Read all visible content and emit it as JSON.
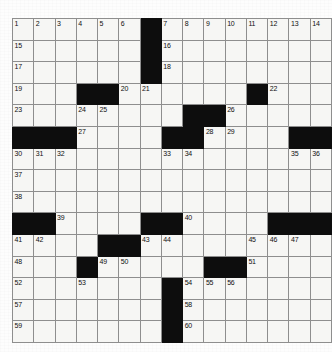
{
  "puzzle": {
    "title": "Crossword Grid",
    "columns": 14,
    "rows": 15,
    "colors": {
      "block": "#0d0d0d",
      "cell": "#f6f6f4",
      "grid_line": "#8e8e8e",
      "number_text": "#101010",
      "page_background": "#fdfdfd"
    },
    "numbers_sequence": [
      1,
      2,
      3,
      4,
      5,
      6,
      7,
      8,
      9,
      10,
      11,
      12,
      13,
      14,
      15,
      16,
      17,
      18,
      19,
      20,
      21,
      22,
      23,
      24,
      25,
      26,
      27,
      28,
      29,
      30,
      31,
      32,
      33,
      34,
      35,
      36,
      37,
      38,
      39,
      40,
      41,
      42,
      43,
      44,
      45,
      46,
      47,
      48,
      49,
      50,
      51,
      52,
      53,
      54,
      55,
      56,
      57,
      58,
      59,
      60
    ],
    "highest_number": 60,
    "grid": [
      [
        {
          "block": false,
          "number": "1"
        },
        {
          "block": false,
          "number": "2"
        },
        {
          "block": false,
          "number": "3"
        },
        {
          "block": false,
          "number": "4"
        },
        {
          "block": false,
          "number": "5"
        },
        {
          "block": false,
          "number": "6"
        },
        {
          "block": true,
          "number": ""
        },
        {
          "block": false,
          "number": "7"
        },
        {
          "block": false,
          "number": "8"
        },
        {
          "block": false,
          "number": "9"
        },
        {
          "block": false,
          "number": "10"
        },
        {
          "block": false,
          "number": "11"
        },
        {
          "block": false,
          "number": "12"
        },
        {
          "block": false,
          "number": "13"
        },
        {
          "block": false,
          "number": "14"
        }
      ],
      [
        {
          "block": false,
          "number": "15"
        },
        {
          "block": false,
          "number": ""
        },
        {
          "block": false,
          "number": ""
        },
        {
          "block": false,
          "number": ""
        },
        {
          "block": false,
          "number": ""
        },
        {
          "block": false,
          "number": ""
        },
        {
          "block": true,
          "number": ""
        },
        {
          "block": false,
          "number": "16"
        },
        {
          "block": false,
          "number": ""
        },
        {
          "block": false,
          "number": ""
        },
        {
          "block": false,
          "number": ""
        },
        {
          "block": false,
          "number": ""
        },
        {
          "block": false,
          "number": ""
        },
        {
          "block": false,
          "number": ""
        },
        {
          "block": false,
          "number": ""
        }
      ],
      [
        {
          "block": false,
          "number": "17"
        },
        {
          "block": false,
          "number": ""
        },
        {
          "block": false,
          "number": ""
        },
        {
          "block": false,
          "number": ""
        },
        {
          "block": false,
          "number": ""
        },
        {
          "block": false,
          "number": ""
        },
        {
          "block": true,
          "number": ""
        },
        {
          "block": false,
          "number": "18"
        },
        {
          "block": false,
          "number": ""
        },
        {
          "block": false,
          "number": ""
        },
        {
          "block": false,
          "number": ""
        },
        {
          "block": false,
          "number": ""
        },
        {
          "block": false,
          "number": ""
        },
        {
          "block": false,
          "number": ""
        },
        {
          "block": false,
          "number": ""
        }
      ],
      [
        {
          "block": false,
          "number": "19"
        },
        {
          "block": false,
          "number": ""
        },
        {
          "block": false,
          "number": ""
        },
        {
          "block": true,
          "number": ""
        },
        {
          "block": true,
          "number": ""
        },
        {
          "block": false,
          "number": "20"
        },
        {
          "block": false,
          "number": "21"
        },
        {
          "block": false,
          "number": ""
        },
        {
          "block": false,
          "number": ""
        },
        {
          "block": false,
          "number": ""
        },
        {
          "block": false,
          "number": ""
        },
        {
          "block": true,
          "number": ""
        },
        {
          "block": false,
          "number": "22"
        },
        {
          "block": false,
          "number": ""
        },
        {
          "block": false,
          "number": ""
        }
      ],
      [
        {
          "block": false,
          "number": "23"
        },
        {
          "block": false,
          "number": ""
        },
        {
          "block": false,
          "number": ""
        },
        {
          "block": false,
          "number": "24"
        },
        {
          "block": false,
          "number": "25"
        },
        {
          "block": false,
          "number": ""
        },
        {
          "block": false,
          "number": ""
        },
        {
          "block": false,
          "number": ""
        },
        {
          "block": true,
          "number": ""
        },
        {
          "block": true,
          "number": ""
        },
        {
          "block": false,
          "number": "26"
        },
        {
          "block": false,
          "number": ""
        },
        {
          "block": false,
          "number": ""
        },
        {
          "block": false,
          "number": ""
        },
        {
          "block": false,
          "number": ""
        }
      ],
      [
        {
          "block": true,
          "number": ""
        },
        {
          "block": true,
          "number": ""
        },
        {
          "block": true,
          "number": ""
        },
        {
          "block": false,
          "number": "27"
        },
        {
          "block": false,
          "number": ""
        },
        {
          "block": false,
          "number": ""
        },
        {
          "block": false,
          "number": ""
        },
        {
          "block": true,
          "number": ""
        },
        {
          "block": true,
          "number": ""
        },
        {
          "block": false,
          "number": "28"
        },
        {
          "block": false,
          "number": "29"
        },
        {
          "block": false,
          "number": ""
        },
        {
          "block": false,
          "number": ""
        },
        {
          "block": true,
          "number": ""
        },
        {
          "block": true,
          "number": ""
        }
      ],
      [
        {
          "block": false,
          "number": "30"
        },
        {
          "block": false,
          "number": "31"
        },
        {
          "block": false,
          "number": "32"
        },
        {
          "block": false,
          "number": ""
        },
        {
          "block": false,
          "number": ""
        },
        {
          "block": false,
          "number": ""
        },
        {
          "block": false,
          "number": ""
        },
        {
          "block": false,
          "number": "33"
        },
        {
          "block": false,
          "number": "34"
        },
        {
          "block": false,
          "number": ""
        },
        {
          "block": false,
          "number": ""
        },
        {
          "block": false,
          "number": ""
        },
        {
          "block": false,
          "number": ""
        },
        {
          "block": false,
          "number": "35"
        },
        {
          "block": false,
          "number": "36"
        }
      ],
      [
        {
          "block": false,
          "number": "37"
        },
        {
          "block": false,
          "number": ""
        },
        {
          "block": false,
          "number": ""
        },
        {
          "block": false,
          "number": ""
        },
        {
          "block": false,
          "number": ""
        },
        {
          "block": false,
          "number": ""
        },
        {
          "block": false,
          "number": ""
        },
        {
          "block": false,
          "number": ""
        },
        {
          "block": false,
          "number": ""
        },
        {
          "block": false,
          "number": ""
        },
        {
          "block": false,
          "number": ""
        },
        {
          "block": false,
          "number": ""
        },
        {
          "block": false,
          "number": ""
        },
        {
          "block": false,
          "number": ""
        },
        {
          "block": false,
          "number": ""
        }
      ],
      [
        {
          "block": false,
          "number": "38"
        },
        {
          "block": false,
          "number": ""
        },
        {
          "block": false,
          "number": ""
        },
        {
          "block": false,
          "number": ""
        },
        {
          "block": false,
          "number": ""
        },
        {
          "block": false,
          "number": ""
        },
        {
          "block": false,
          "number": ""
        },
        {
          "block": false,
          "number": ""
        },
        {
          "block": false,
          "number": ""
        },
        {
          "block": false,
          "number": ""
        },
        {
          "block": false,
          "number": ""
        },
        {
          "block": false,
          "number": ""
        },
        {
          "block": false,
          "number": ""
        },
        {
          "block": false,
          "number": ""
        },
        {
          "block": false,
          "number": ""
        }
      ],
      [
        {
          "block": true,
          "number": ""
        },
        {
          "block": true,
          "number": ""
        },
        {
          "block": false,
          "number": "39"
        },
        {
          "block": false,
          "number": ""
        },
        {
          "block": false,
          "number": ""
        },
        {
          "block": false,
          "number": ""
        },
        {
          "block": true,
          "number": ""
        },
        {
          "block": true,
          "number": ""
        },
        {
          "block": false,
          "number": "40"
        },
        {
          "block": false,
          "number": ""
        },
        {
          "block": false,
          "number": ""
        },
        {
          "block": false,
          "number": ""
        },
        {
          "block": true,
          "number": ""
        },
        {
          "block": true,
          "number": ""
        },
        {
          "block": true,
          "number": ""
        }
      ],
      [
        {
          "block": false,
          "number": "41"
        },
        {
          "block": false,
          "number": "42"
        },
        {
          "block": false,
          "number": ""
        },
        {
          "block": false,
          "number": ""
        },
        {
          "block": true,
          "number": ""
        },
        {
          "block": true,
          "number": ""
        },
        {
          "block": false,
          "number": "43"
        },
        {
          "block": false,
          "number": "44"
        },
        {
          "block": false,
          "number": ""
        },
        {
          "block": false,
          "number": ""
        },
        {
          "block": false,
          "number": ""
        },
        {
          "block": false,
          "number": "45"
        },
        {
          "block": false,
          "number": "46"
        },
        {
          "block": false,
          "number": "47"
        },
        {
          "block": false,
          "number": ""
        }
      ],
      [
        {
          "block": false,
          "number": "48"
        },
        {
          "block": false,
          "number": ""
        },
        {
          "block": false,
          "number": ""
        },
        {
          "block": true,
          "number": ""
        },
        {
          "block": false,
          "number": "49"
        },
        {
          "block": false,
          "number": "50"
        },
        {
          "block": false,
          "number": ""
        },
        {
          "block": false,
          "number": ""
        },
        {
          "block": false,
          "number": ""
        },
        {
          "block": true,
          "number": ""
        },
        {
          "block": true,
          "number": ""
        },
        {
          "block": false,
          "number": "51"
        },
        {
          "block": false,
          "number": ""
        },
        {
          "block": false,
          "number": ""
        },
        {
          "block": false,
          "number": ""
        }
      ],
      [
        {
          "block": false,
          "number": "52"
        },
        {
          "block": false,
          "number": ""
        },
        {
          "block": false,
          "number": ""
        },
        {
          "block": false,
          "number": "53"
        },
        {
          "block": false,
          "number": ""
        },
        {
          "block": false,
          "number": ""
        },
        {
          "block": false,
          "number": ""
        },
        {
          "block": true,
          "number": ""
        },
        {
          "block": false,
          "number": "54"
        },
        {
          "block": false,
          "number": "55"
        },
        {
          "block": false,
          "number": "56"
        },
        {
          "block": false,
          "number": ""
        },
        {
          "block": false,
          "number": ""
        },
        {
          "block": false,
          "number": ""
        },
        {
          "block": false,
          "number": ""
        }
      ],
      [
        {
          "block": false,
          "number": "57"
        },
        {
          "block": false,
          "number": ""
        },
        {
          "block": false,
          "number": ""
        },
        {
          "block": false,
          "number": ""
        },
        {
          "block": false,
          "number": ""
        },
        {
          "block": false,
          "number": ""
        },
        {
          "block": false,
          "number": ""
        },
        {
          "block": true,
          "number": ""
        },
        {
          "block": false,
          "number": "58"
        },
        {
          "block": false,
          "number": ""
        },
        {
          "block": false,
          "number": ""
        },
        {
          "block": false,
          "number": ""
        },
        {
          "block": false,
          "number": ""
        },
        {
          "block": false,
          "number": ""
        },
        {
          "block": false,
          "number": ""
        }
      ],
      [
        {
          "block": false,
          "number": "59"
        },
        {
          "block": false,
          "number": ""
        },
        {
          "block": false,
          "number": ""
        },
        {
          "block": false,
          "number": ""
        },
        {
          "block": false,
          "number": ""
        },
        {
          "block": false,
          "number": ""
        },
        {
          "block": false,
          "number": ""
        },
        {
          "block": true,
          "number": ""
        },
        {
          "block": false,
          "number": "60"
        },
        {
          "block": false,
          "number": ""
        },
        {
          "block": false,
          "number": ""
        },
        {
          "block": false,
          "number": ""
        },
        {
          "block": false,
          "number": ""
        },
        {
          "block": false,
          "number": ""
        },
        {
          "block": false,
          "number": ""
        }
      ]
    ]
  }
}
